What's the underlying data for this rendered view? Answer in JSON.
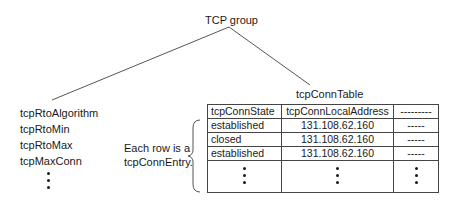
{
  "diagram": {
    "root": "TCP group",
    "scalars": [
      "tcpRtoAlgorithm",
      "tcpRtoMin",
      "tcpRtoMax",
      "tcpMaxConn"
    ],
    "table_title": "tcpConnTable",
    "annotation_line1": "Each row is a",
    "annotation_line2": "tcpConnEntry.",
    "table": {
      "headers": [
        "tcpConnState",
        "tcpConnLocalAddress",
        "---------"
      ],
      "rows": [
        [
          "established",
          "131.108.62.160",
          "-----"
        ],
        [
          "closed",
          "131.108.62.160",
          "-----"
        ],
        [
          "established",
          "131.108.62.160",
          "-----"
        ]
      ]
    }
  }
}
